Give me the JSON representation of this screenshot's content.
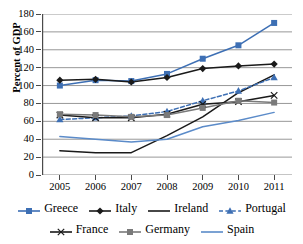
{
  "chart_data": {
    "type": "line",
    "title": "",
    "xlabel": "",
    "ylabel": "Percent of GDP",
    "categories": [
      "2005",
      "2006",
      "2007",
      "2008",
      "2009",
      "2010",
      "2011"
    ],
    "ylim": [
      0,
      180
    ],
    "ytick_step": 20,
    "yticks": [
      "180",
      "160",
      "140",
      "120",
      "100",
      "80",
      "60",
      "40",
      "20",
      "0"
    ],
    "grid": "horizontal",
    "legend_position": "bottom",
    "series": [
      {
        "name": "Greece",
        "values": [
          100,
          106,
          105,
          113,
          130,
          145,
          170
        ],
        "color": "#3d6fb4",
        "marker": "square",
        "dash": "solid"
      },
      {
        "name": "Italy",
        "values": [
          106,
          107,
          104,
          109,
          119,
          122,
          124
        ],
        "color": "#1a1a1a",
        "marker": "diamond",
        "dash": "solid"
      },
      {
        "name": "Ireland",
        "values": [
          27,
          25,
          25,
          44,
          65,
          92,
          112
        ],
        "color": "#1a1a1a",
        "marker": "none",
        "dash": "solid"
      },
      {
        "name": "Portugal",
        "values": [
          62,
          64,
          66,
          71,
          83,
          94,
          109
        ],
        "color": "#3d6fb4",
        "marker": "triangle",
        "dash": "dashed"
      },
      {
        "name": "France",
        "values": [
          67,
          64,
          64,
          68,
          79,
          82,
          89
        ],
        "color": "#1a1a1a",
        "marker": "x",
        "dash": "solid"
      },
      {
        "name": "Germany",
        "values": [
          68,
          67,
          65,
          67,
          75,
          83,
          81
        ],
        "color": "#7a7a7a",
        "marker": "square",
        "dash": "solid"
      },
      {
        "name": "Spain",
        "values": [
          43,
          40,
          37,
          40,
          54,
          61,
          70
        ],
        "color": "#5b8bc9",
        "marker": "none",
        "dash": "solid"
      }
    ]
  },
  "axis": {
    "ylabel": "Percent of GDP"
  }
}
